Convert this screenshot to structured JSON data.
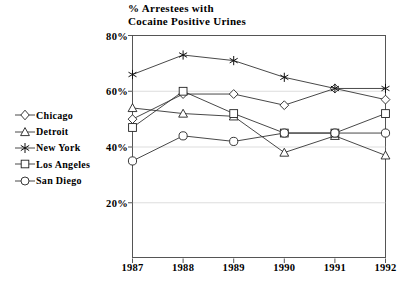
{
  "chart_data": {
    "type": "line",
    "title": "% Arrestees with\nCocaine Positive Urines",
    "xlabel": "",
    "ylabel": "",
    "categories": [
      "1987",
      "1988",
      "1989",
      "1990",
      "1991",
      "1992"
    ],
    "x": [
      1987,
      1988,
      1989,
      1990,
      1991,
      1992
    ],
    "ylim": [
      0,
      80
    ],
    "yticks": [
      "20%",
      "40%",
      "60%",
      "80%"
    ],
    "ytick_values": [
      20,
      40,
      60,
      80
    ],
    "grid": true,
    "legend_position": "left-outside",
    "series": [
      {
        "name": "Chicago",
        "marker": "diamond",
        "values": [
          50,
          59,
          59,
          55,
          61,
          57
        ]
      },
      {
        "name": "Detroit",
        "marker": "triangle",
        "values": [
          54,
          52,
          51,
          38,
          44,
          37
        ]
      },
      {
        "name": "New York",
        "marker": "star",
        "values": [
          66,
          73,
          71,
          65,
          61,
          61
        ]
      },
      {
        "name": "Los Angeles",
        "marker": "square",
        "values": [
          47,
          60,
          52,
          45,
          45,
          52
        ]
      },
      {
        "name": "San Diego",
        "marker": "circle",
        "values": [
          35,
          44,
          42,
          45,
          45,
          45
        ]
      }
    ]
  },
  "legend": {
    "items": [
      {
        "label": "Chicago",
        "marker": "diamond-marker-icon"
      },
      {
        "label": "Detroit",
        "marker": "triangle-marker-icon"
      },
      {
        "label": "New York",
        "marker": "star-marker-icon"
      },
      {
        "label": "Los Angeles",
        "marker": "square-marker-icon"
      },
      {
        "label": "San Diego",
        "marker": "circle-marker-icon"
      }
    ]
  },
  "colors": {
    "line": "#333333",
    "marker_fill": "#ffffff",
    "marker_stroke": "#222222",
    "grid": "#cfcfcf",
    "frame": "#555555",
    "text": "#000000",
    "background": "#ffffff"
  }
}
